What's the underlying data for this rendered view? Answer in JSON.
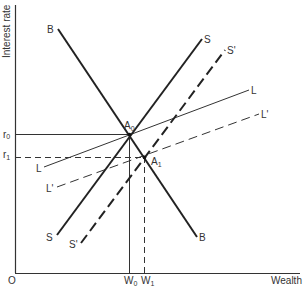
{
  "diagram": {
    "y_axis_label": "Interest rate",
    "x_axis_label": "Wealth",
    "origin_label": "O",
    "r0_label": "r",
    "r0_sub": "0",
    "r1_label": "r",
    "r1_sub": "1",
    "w0_label": "W",
    "w0_sub": "0",
    "w1_label": "W",
    "w1_sub": "1",
    "a0_label": "A",
    "a0_sub": "0",
    "a1_label": "A",
    "a1_sub": "1",
    "curves": {
      "B_top": "B",
      "B_bottom": "B",
      "S_top": "S",
      "S_bottom": "S",
      "Sp_top": "S'",
      "Sp_bottom": "S'",
      "L_right": "L",
      "L_left": "L",
      "Lp_right": "L'",
      "Lp_left": "L'"
    },
    "colors": {
      "line": "#222222",
      "axis": "#333333"
    }
  }
}
